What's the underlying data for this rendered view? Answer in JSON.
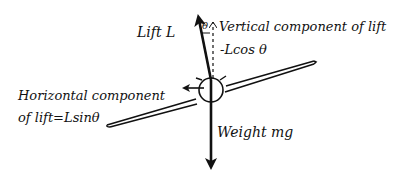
{
  "diagram": {
    "colors": {
      "ink": "#111111",
      "background": "#ffffff"
    },
    "labels": {
      "lift": "Lift L",
      "theta": "θ",
      "vertical_component_line1": "Vertical component of lift",
      "vertical_component_line2": "-Lcos θ",
      "horizontal_component_line1": "Horizontal component",
      "horizontal_component_line2": "of lift=Lsinθ",
      "weight": "Weight mg"
    },
    "elements": [
      {
        "id": "lift-arrow",
        "kind": "arrow",
        "from": [
          211,
          78
        ],
        "to": [
          198,
          17
        ]
      },
      {
        "id": "vertical-component",
        "kind": "dashed-arrow",
        "from": [
          213,
          78
        ],
        "to": [
          213,
          20
        ]
      },
      {
        "id": "weight-arrow",
        "kind": "arrow",
        "from": [
          211,
          78
        ],
        "to": [
          211,
          168
        ]
      },
      {
        "id": "horizontal-component",
        "kind": "arrow",
        "from": [
          203,
          88
        ],
        "to": [
          184,
          88
        ]
      },
      {
        "id": "fuselage",
        "kind": "circle",
        "center": [
          211,
          90
        ],
        "radius": 12
      },
      {
        "id": "wing",
        "kind": "tapered-wing",
        "left_tip": [
          107,
          125
        ],
        "right_tip": [
          314,
          62
        ]
      }
    ]
  }
}
